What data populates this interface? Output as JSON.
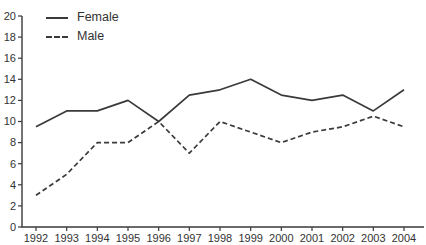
{
  "chart_data": {
    "type": "line",
    "title": "",
    "xlabel": "",
    "ylabel": "",
    "x": [
      1992,
      1993,
      1994,
      1995,
      1996,
      1997,
      1998,
      1999,
      2000,
      2001,
      2002,
      2003,
      2004
    ],
    "series": [
      {
        "name": "Female",
        "line_style": "solid",
        "values": [
          9.5,
          11,
          11,
          12,
          10,
          12.5,
          13,
          14,
          12.5,
          12,
          12.5,
          11,
          13
        ]
      },
      {
        "name": "Male",
        "line_style": "dashed",
        "values": [
          3,
          5,
          8,
          8,
          10,
          7,
          10,
          9,
          8,
          9,
          9.5,
          10.5,
          9.5
        ]
      }
    ],
    "ylim": [
      0,
      20
    ],
    "ytick_step": 2,
    "grid": false,
    "legend_position": "top-left"
  },
  "colors": {
    "line": "#3a3a3a",
    "axis": "#3a3a3a",
    "tick_text": "#333333",
    "background": "#ffffff"
  }
}
